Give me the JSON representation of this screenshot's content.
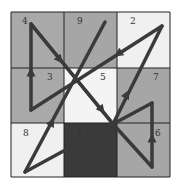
{
  "diagram": {
    "type": "magic-square-path",
    "grid": {
      "rows": 3,
      "cols": 3,
      "x": 11,
      "y": 12,
      "width": 159,
      "height": 165,
      "col_edges": [
        11,
        64,
        117,
        170
      ],
      "row_edges": [
        12,
        68,
        123,
        177
      ],
      "border_color": "#222222"
    },
    "cells": [
      {
        "row": 0,
        "col": 0,
        "label": "4",
        "fill": "#a9a9a9",
        "label_x": 22,
        "label_y": 24
      },
      {
        "row": 0,
        "col": 1,
        "label": "9",
        "fill": "#a6a6a6",
        "label_x": 77,
        "label_y": 24
      },
      {
        "row": 0,
        "col": 2,
        "label": "2",
        "fill": "#f0f0f0",
        "label_x": 130,
        "label_y": 24
      },
      {
        "row": 1,
        "col": 0,
        "label": "3",
        "fill": "#a9a9a9",
        "label_x": 47,
        "label_y": 80
      },
      {
        "row": 1,
        "col": 1,
        "label": "5",
        "fill": "#f4f4f4",
        "label_x": 100,
        "label_y": 80
      },
      {
        "row": 1,
        "col": 2,
        "label": "7",
        "fill": "#a6a6a6",
        "label_x": 153,
        "label_y": 80
      },
      {
        "row": 2,
        "col": 0,
        "label": "8",
        "fill": "#f0f0f0",
        "label_x": 23,
        "label_y": 136
      },
      {
        "row": 2,
        "col": 1,
        "label": "1",
        "fill": "#3a3a3a",
        "label_x": 77,
        "label_y": 136
      },
      {
        "row": 2,
        "col": 2,
        "label": "6",
        "fill": "#a6a6a6",
        "label_x": 155,
        "label_y": 136
      }
    ],
    "path": {
      "stroke": "#3a3a3a",
      "stroke_width": 3.5,
      "segments": [
        {
          "from": [
            25,
            172
          ],
          "to": [
            105,
            22
          ],
          "arrow_at": [
            52,
            122
          ]
        },
        {
          "from": [
            31,
            24
          ],
          "to": [
            113,
            124
          ],
          "arrow_at": [
            60,
            60
          ]
        },
        {
          "from": [
            31,
            24
          ],
          "to": [
            113,
            124
          ],
          "arrow_at": [
            102,
            110
          ]
        },
        {
          "from": [
            31,
            110
          ],
          "to": [
            31,
            24
          ],
          "arrow_at": [
            31,
            72
          ]
        },
        {
          "from": [
            162,
            26
          ],
          "to": [
            31,
            110
          ],
          "arrow_at": [
            118,
            54
          ]
        },
        {
          "from": [
            113,
            124
          ],
          "to": [
            162,
            26
          ],
          "arrow_at": [
            127,
            94
          ]
        },
        {
          "from": [
            113,
            124
          ],
          "to": [
            25,
            172
          ],
          "arrow_at": null
        },
        {
          "from": [
            113,
            124
          ],
          "to": [
            152,
            167
          ],
          "arrow_at": null
        },
        {
          "from": [
            152,
            167
          ],
          "to": [
            152,
            103
          ],
          "arrow_at": [
            152,
            138
          ]
        },
        {
          "from": [
            152,
            103
          ],
          "to": [
            113,
            124
          ],
          "arrow_at": null
        }
      ]
    }
  }
}
